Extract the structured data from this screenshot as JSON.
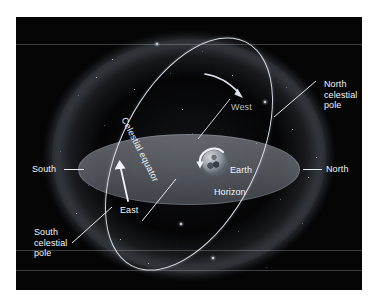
{
  "figure": {
    "background_color": "#050506",
    "page_color": "#ffffff",
    "label_color": "#f2f5f8",
    "horizon_color": "#8d939c",
    "ring_color": "#e8eef5"
  },
  "labels": {
    "north_celestial_pole": "North\ncelestial\npole",
    "south_celestial_pole": "South\ncelestial\npole",
    "north": "North",
    "south": "South",
    "east": "East",
    "west": "West",
    "earth": "Earth",
    "horizon": "Horizon",
    "celestial_equator": "Celestial equator"
  },
  "elements": {
    "celestial_sphere": "celestial-sphere-glow",
    "star_field": "star-field",
    "horizon_plane": "horizon-plane-ellipse",
    "equator_ring": "celestial-equator-ring",
    "earth_globe": "earth-globe",
    "earth_rotation_arrow": "earth-rotation-arrow",
    "ring_motion_arrow_lower": "ring-motion-arrow-up",
    "ring_motion_arrow_upper": "ring-motion-arrow-down"
  }
}
